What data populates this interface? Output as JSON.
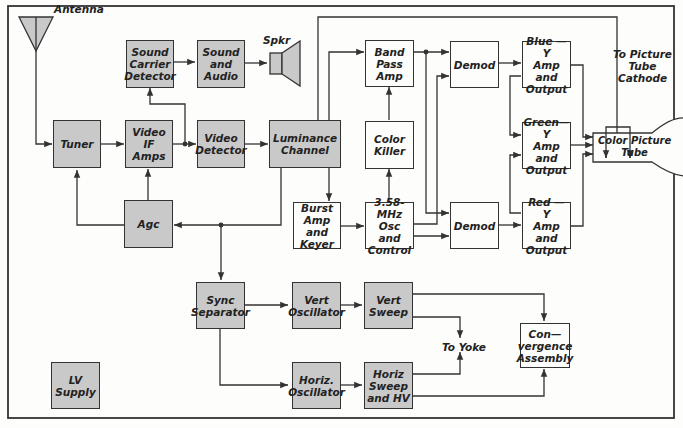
{
  "diagram": {
    "blocks": {
      "sound_carrier_detector": "Sound\nCarrier\nDetector",
      "sound_and_audio": "Sound\nand\nAudio",
      "tuner": "Tuner",
      "video_if_amps": "Video IF\nAmps",
      "video_detector": "Video\nDetector",
      "luminance_channel": "Luminance\nChannel",
      "agc": "Agc",
      "band_pass_amp": "Band\nPass\nAmp",
      "color_killer": "Color\nKiller",
      "burst_amp_keyer": "Burst\nAmp and\nKeyer",
      "osc_control": "3.58-MHz\nOsc and\nControl",
      "demod_top": "Demod",
      "demod_bottom": "Demod",
      "blue_y": "Blue — Y\nAmp and\nOutput",
      "green_y": "Green—Y\nAmp and\nOutput",
      "red_y": "Red — Y\nAmp and\nOutput",
      "color_picture_tube": "Color Picture\nTube",
      "sync_separator": "Sync\nSeparator",
      "vert_oscillator": "Vert\nOscillator",
      "vert_sweep": "Vert\nSweep",
      "horiz_oscillator": "Horiz.\nOscillator",
      "horiz_sweep_hv": "Horiz\nSweep\nand HV",
      "convergence_assembly": "Con—\nvergence\nAssembly",
      "lv_supply": "LV\nSupply"
    },
    "labels": {
      "antenna": "Antenna",
      "speaker": "Spkr",
      "to_picture_tube_cathode": "To Picture\nTube\nCathode",
      "to_yoke": "To Yoke"
    },
    "colors": {
      "shaded_fill": "#c9c9c9",
      "plain_fill": "#fdfdfb",
      "line": "#333333"
    }
  }
}
